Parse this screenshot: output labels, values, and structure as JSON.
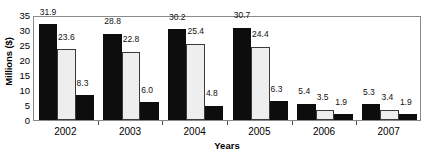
{
  "chart_data": {
    "type": "bar",
    "title": "",
    "xlabel": "Years",
    "ylabel": "Millions ($)",
    "categories": [
      "2002",
      "2003",
      "2004",
      "2005",
      "2006",
      "2007"
    ],
    "series": [
      {
        "name": "series-1",
        "color": "#0d0d0d",
        "values": [
          31.9,
          28.8,
          30.2,
          30.7,
          5.4,
          5.3
        ]
      },
      {
        "name": "series-2",
        "color": "#eeeeee",
        "values": [
          23.6,
          22.8,
          25.4,
          24.4,
          3.5,
          3.4
        ]
      },
      {
        "name": "series-3",
        "color": "#0d0d0d",
        "values": [
          8.3,
          6.0,
          4.8,
          6.3,
          1.9,
          1.9
        ]
      }
    ],
    "data_labels": [
      [
        "31.9",
        "23.6",
        "8.3"
      ],
      [
        "28.8",
        "22.8",
        "6.0"
      ],
      [
        "30.2",
        "25.4",
        "4.8"
      ],
      [
        "30.7",
        "24.4",
        "6.3"
      ],
      [
        "5.4",
        "3.5",
        "1.9"
      ],
      [
        "5.3",
        "3.4",
        "1.9"
      ]
    ],
    "yticks": [
      0,
      5,
      10,
      15,
      20,
      25,
      30,
      35
    ],
    "ytick_labels": [
      "0",
      "5",
      "10",
      "15",
      "20",
      "25",
      "30",
      "35"
    ],
    "ylim": [
      0,
      35
    ],
    "grid": false,
    "legend": "none"
  }
}
